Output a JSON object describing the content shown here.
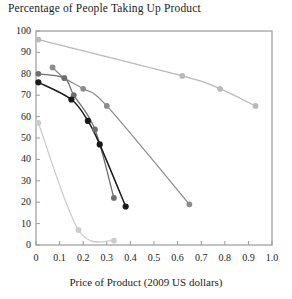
{
  "chart_data": {
    "type": "scatter",
    "title": "Percentage of People Taking Up Product",
    "xlabel": "Price of Product (2009 US dollars)",
    "ylabel": "",
    "xlim": [
      0,
      1.0
    ],
    "ylim": [
      0,
      100
    ],
    "grid": false,
    "legend": "none",
    "xticks": [
      "0",
      "0.1",
      "0.2",
      "0.3",
      "0.4",
      "0.5",
      "0.6",
      "0.7",
      "0.8",
      "0.9",
      "1.0"
    ],
    "xtick_values": [
      0,
      0.1,
      0.2,
      0.3,
      0.4,
      0.5,
      0.6,
      0.7,
      0.8,
      0.9,
      1.0
    ],
    "yticks": [
      "0",
      "10",
      "20",
      "30",
      "40",
      "50",
      "60",
      "70",
      "80",
      "90",
      "100"
    ],
    "ytick_values": [
      0,
      10,
      20,
      30,
      40,
      50,
      60,
      70,
      80,
      90,
      100
    ],
    "series": [
      {
        "name": "series-1-lightest-gray",
        "color": "#b9b9b9",
        "fit": "linear-decline",
        "x": [
          0.01,
          0.62,
          0.78,
          0.93
        ],
        "y": [
          96,
          79,
          73,
          65
        ]
      },
      {
        "name": "series-2-mid-gray",
        "color": "#8d8d8d",
        "fit": "curved-decline",
        "x": [
          0.07,
          0.12,
          0.2,
          0.3,
          0.65
        ],
        "y": [
          83,
          78,
          73,
          65,
          19
        ]
      },
      {
        "name": "series-3-dark-gray",
        "color": "#6e6e6e",
        "fit": "steep-decline",
        "x": [
          0.01,
          0.12,
          0.16,
          0.25,
          0.33
        ],
        "y": [
          80,
          78,
          70,
          54,
          22
        ]
      },
      {
        "name": "series-4-black",
        "color": "#1a1a1a",
        "fit": "steep-decline",
        "x": [
          0.01,
          0.15,
          0.22,
          0.27,
          0.38
        ],
        "y": [
          76,
          68,
          58,
          47,
          18
        ]
      },
      {
        "name": "series-5-pale-gray",
        "color": "#cccccc",
        "fit": "convex-decline",
        "x": [
          0.01,
          0.18,
          0.33
        ],
        "y": [
          57,
          7,
          2
        ]
      }
    ]
  },
  "axes": {
    "plot_left_px": 36,
    "plot_right_px": 272,
    "plot_top_px": 31,
    "plot_bottom_px": 245,
    "frame_color": "#9a9a9a"
  }
}
